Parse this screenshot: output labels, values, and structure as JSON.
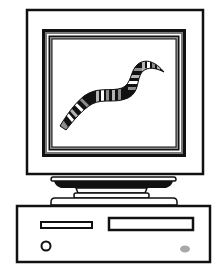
{
  "illustration": {
    "subject": "computer",
    "style": "black and white clip art",
    "monitor": {
      "screen_content": "worm",
      "screen_background": "#ffffff"
    },
    "worm": {
      "band_colors": [
        "#111111",
        "#8c8c8c",
        "#ffffff",
        "#b5b5b5"
      ]
    },
    "system_unit": {
      "floppy_slot": true,
      "drive_bay": true,
      "power_button": true,
      "led_color": "#a8a8a8"
    }
  },
  "colors": {
    "outline": "#111111",
    "bezel_gray": "#7a7a7a",
    "fill": "#ffffff"
  }
}
